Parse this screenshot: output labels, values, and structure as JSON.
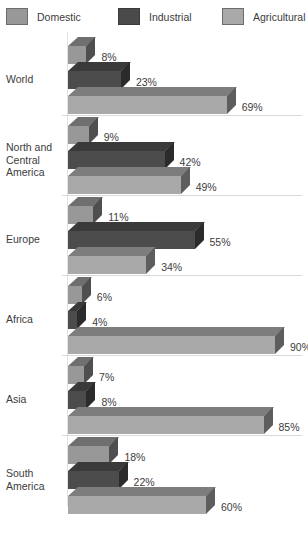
{
  "legend": {
    "items": [
      {
        "label": "Domestic",
        "key": "domestic",
        "color": "#989898",
        "x": 6
      },
      {
        "label": "Industrial",
        "key": "industrial",
        "color": "#4c4c4c",
        "x": 118
      },
      {
        "label": "Agricultural",
        "key": "agricultural",
        "color": "#a9a9a9",
        "x": 222
      }
    ]
  },
  "chart_data": {
    "type": "bar",
    "title": "",
    "xlabel": "",
    "ylabel": "",
    "xlim": [
      0,
      100
    ],
    "orientation": "horizontal",
    "grid": false,
    "legend_position": "top",
    "unit": "%",
    "categories": [
      "World",
      "North and Central America",
      "Europe",
      "Africa",
      "Asia",
      "South America"
    ],
    "series": [
      {
        "name": "Domestic",
        "values": [
          8,
          9,
          11,
          6,
          7,
          18
        ]
      },
      {
        "name": "Industrial",
        "values": [
          23,
          42,
          55,
          4,
          8,
          22
        ]
      },
      {
        "name": "Agricultural",
        "values": [
          69,
          49,
          34,
          90,
          85,
          60
        ]
      }
    ],
    "groups": [
      {
        "label": "World",
        "label_lines": [
          "World"
        ],
        "bars": [
          {
            "series": "Domestic",
            "value": 8,
            "value_label": "8%"
          },
          {
            "series": "Industrial",
            "value": 23,
            "value_label": "23%"
          },
          {
            "series": "Agricultural",
            "value": 69,
            "value_label": "69%"
          }
        ]
      },
      {
        "label": "North and Central America",
        "label_lines": [
          "North and",
          "Central",
          "America"
        ],
        "bars": [
          {
            "series": "Domestic",
            "value": 9,
            "value_label": "9%"
          },
          {
            "series": "Industrial",
            "value": 42,
            "value_label": "42%"
          },
          {
            "series": "Agricultural",
            "value": 49,
            "value_label": "49%"
          }
        ]
      },
      {
        "label": "Europe",
        "label_lines": [
          "Europe"
        ],
        "bars": [
          {
            "series": "Domestic",
            "value": 11,
            "value_label": "11%"
          },
          {
            "series": "Industrial",
            "value": 55,
            "value_label": "55%"
          },
          {
            "series": "Agricultural",
            "value": 34,
            "value_label": "34%"
          }
        ]
      },
      {
        "label": "Africa",
        "label_lines": [
          "Africa"
        ],
        "bars": [
          {
            "series": "Domestic",
            "value": 6,
            "value_label": "6%"
          },
          {
            "series": "Industrial",
            "value": 4,
            "value_label": "4%"
          },
          {
            "series": "Agricultural",
            "value": 90,
            "value_label": "90%"
          }
        ]
      },
      {
        "label": "Asia",
        "label_lines": [
          "Asia"
        ],
        "bars": [
          {
            "series": "Domestic",
            "value": 7,
            "value_label": "7%"
          },
          {
            "series": "Industrial",
            "value": 8,
            "value_label": "8%"
          },
          {
            "series": "Agricultural",
            "value": 85,
            "value_label": "85%"
          }
        ]
      },
      {
        "label": "South America",
        "label_lines": [
          "South",
          "America"
        ],
        "bars": [
          {
            "series": "Domestic",
            "value": 18,
            "value_label": "18%"
          },
          {
            "series": "Industrial",
            "value": 22,
            "value_label": "22%"
          },
          {
            "series": "Agricultural",
            "value": 60,
            "value_label": "60%"
          }
        ]
      }
    ]
  }
}
